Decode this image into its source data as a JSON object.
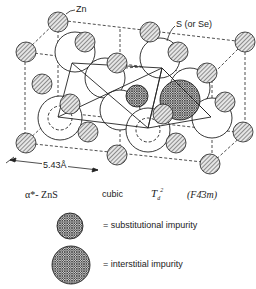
{
  "labels": {
    "zn": "Zn",
    "s_or_se": "S (or Se)",
    "lattice_constant": "5.43Å"
  },
  "caption": {
    "structure": "α*- ZnS",
    "system": "cubic",
    "point_group": "T",
    "point_group_sub": "d",
    "point_group_sup": "2",
    "space_group": "(F4̄3m)"
  },
  "legend": {
    "items": [
      {
        "symbol": "small-crosshatched-circle",
        "text": "= substitutional impurity"
      },
      {
        "symbol": "large-crosshatched-circle",
        "text": "= interstitial impurity"
      }
    ]
  },
  "colors": {
    "line": "#222222",
    "background": "#ffffff"
  }
}
